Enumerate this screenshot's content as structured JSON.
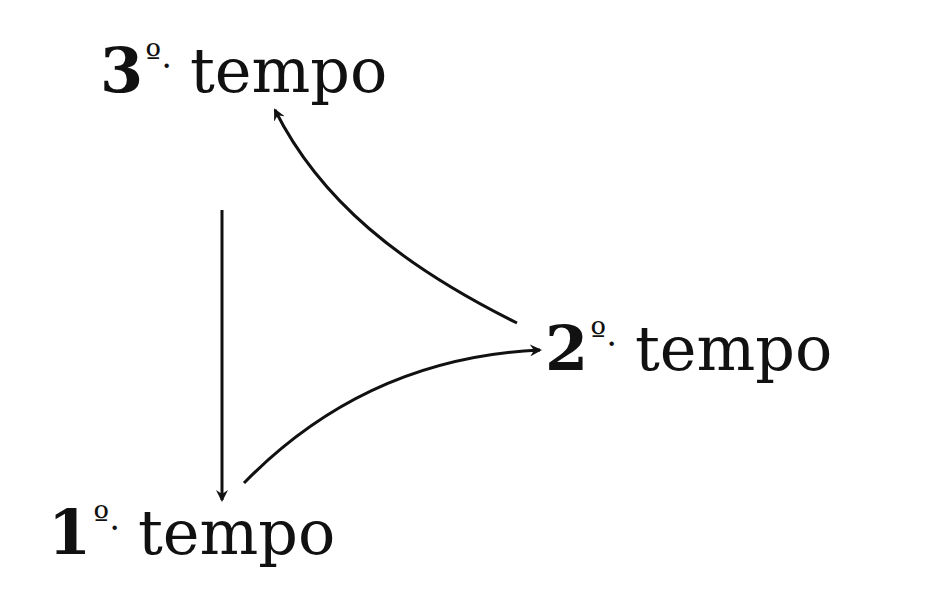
{
  "diagram": {
    "nodes": [
      {
        "id": "t3",
        "number": "3",
        "ordinal": "º.",
        "word": "tempo"
      },
      {
        "id": "t2",
        "number": "2",
        "ordinal": "º.",
        "word": "tempo"
      },
      {
        "id": "t1",
        "number": "1",
        "ordinal": "º.",
        "word": "tempo"
      }
    ],
    "edges": [
      {
        "from": "1.º tempo",
        "to": "2.º tempo",
        "style": "curved"
      },
      {
        "from": "2.º tempo",
        "to": "3.º tempo",
        "style": "curved"
      },
      {
        "from": "3.º tempo",
        "to": "1.º tempo",
        "style": "straight"
      }
    ],
    "colors": {
      "ink": "#111111",
      "background": "#ffffff"
    }
  }
}
